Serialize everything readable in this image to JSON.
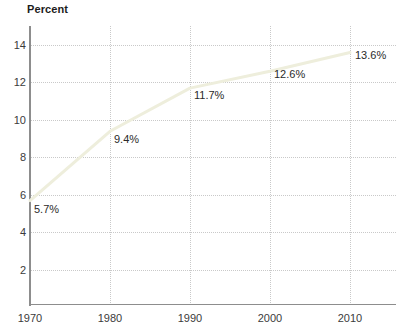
{
  "chart_data": {
    "type": "line",
    "title": "",
    "ylabel": "Percent",
    "xlabel": "",
    "x": [
      1970,
      1980,
      1990,
      2000,
      2010
    ],
    "categories": [
      "1970",
      "1980",
      "1990",
      "2000",
      "2010"
    ],
    "values": [
      5.7,
      9.4,
      11.7,
      12.6,
      13.6
    ],
    "point_labels": [
      "5.7%",
      "9.4%",
      "11.7%",
      "12.6%",
      "13.6%"
    ],
    "xlim": [
      1970,
      2010
    ],
    "ylim": [
      0,
      15
    ],
    "ytick_values": [
      2,
      4,
      6,
      8,
      10,
      12,
      14
    ],
    "ytick_labels": [
      "2",
      "4",
      "6",
      "8",
      "10",
      "12",
      "14"
    ],
    "xtick_labels": [
      "1970",
      "1980",
      "1990",
      "2000",
      "2010"
    ],
    "grid": true,
    "legend": "none",
    "series": [
      {
        "name": "Percent",
        "values": [
          5.7,
          9.4,
          11.7,
          12.6,
          13.6
        ]
      }
    ],
    "colors": {
      "line": "#eeeedc",
      "grid": "#c9c9c9",
      "axis": "#8d8d8d",
      "text": "#3b3b3b",
      "background": "#ffffff"
    }
  },
  "axis": {
    "y_title": "Percent",
    "y_ticks": [
      "14",
      "12",
      "10",
      "8",
      "6",
      "4",
      "2"
    ],
    "x_ticks": [
      "1970",
      "1980",
      "1990",
      "2000",
      "2010"
    ]
  },
  "labels": {
    "p1970": "5.7%",
    "p1980": "9.4%",
    "p1990": "11.7%",
    "p2000": "12.6%",
    "p2010": "13.6%"
  }
}
